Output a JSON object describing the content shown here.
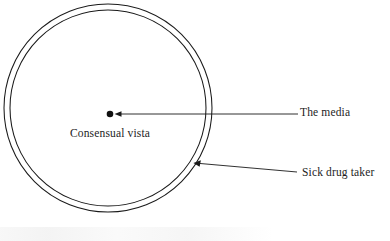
{
  "figure": {
    "title": "",
    "background_color": "#ffffff",
    "stroke_color": "#1a1a1a",
    "text_color": "#1d1d1d"
  },
  "annulus": {
    "name": "consensual-vista-ring",
    "center_x": 108,
    "center_y": 108,
    "outer_rx": 104,
    "outer_ry": 104,
    "inner_rx": 98,
    "inner_ry": 98,
    "stroke_width": 1
  },
  "center_point": {
    "name": "media-point",
    "x": 110,
    "y": 114,
    "radius": 3.2
  },
  "labels": {
    "center": {
      "text": "Consensual vista",
      "x": 70,
      "y": 128
    },
    "media": {
      "text": "The media",
      "x": 300,
      "y": 107
    },
    "sick_drug_taker": {
      "text": "Sick drug taker",
      "x": 302,
      "y": 167
    }
  },
  "leaders": {
    "media_arrow": {
      "from_x": 298,
      "from_y": 114,
      "to_x": 116,
      "to_y": 114
    },
    "sick_arrow": {
      "from_x": 297,
      "from_y": 172,
      "to_x": 194,
      "to_y": 163
    }
  }
}
